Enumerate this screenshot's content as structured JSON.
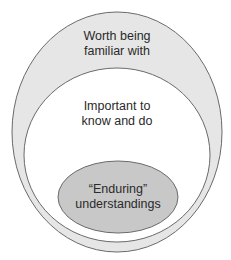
{
  "diagram": {
    "type": "nested-ellipses",
    "colors": {
      "outer_fill": "#e6e6e6",
      "middle_fill": "#ffffff",
      "inner_fill": "#c8c8c8",
      "stroke": "#6a6a6a"
    },
    "outer": {
      "line1": "Worth being",
      "line2": "familiar with"
    },
    "middle": {
      "line1": "Important to",
      "line2": "know and do"
    },
    "inner": {
      "line1": "“Enduring”",
      "line2": "understandings"
    }
  }
}
